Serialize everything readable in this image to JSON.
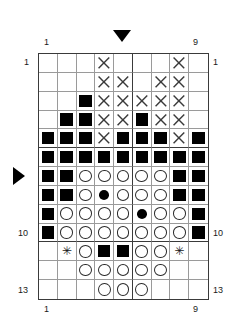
{
  "chart": {
    "columns": 9,
    "rows": 13,
    "legend_symbols": {
      "black_square": "filled-square",
      "cross": "x-cross",
      "open_circle": "open-circle",
      "filled_dot": "filled-dot",
      "asterisk": "asterisk",
      "empty": "blank"
    },
    "section_divider_after_column": 5,
    "section_divider_after_rows": [
      5,
      10
    ],
    "labels": {
      "top_left": "1",
      "top_right": "9",
      "bottom_left": "1",
      "bottom_right": "9",
      "left_row_first": "1",
      "left_row_ten": "10",
      "left_row_last": "13",
      "right_row_first": "1",
      "right_row_ten": "10",
      "right_row_last": "13"
    },
    "markers": {
      "top_center_triangle": "triangle-down",
      "left_row_triangle": "triangle-right",
      "left_triangle_row": 7,
      "top_triangle_column": 5
    },
    "grid": [
      [
        "e",
        "e",
        "e",
        "x",
        "e",
        "e",
        "e",
        "x",
        "e"
      ],
      [
        "e",
        "e",
        "e",
        "x",
        "x",
        "e",
        "x",
        "x",
        "e"
      ],
      [
        "e",
        "e",
        "s",
        "x",
        "x",
        "x",
        "x",
        "x",
        "e"
      ],
      [
        "e",
        "s",
        "s",
        "x",
        "x",
        "s",
        "x",
        "x",
        "e"
      ],
      [
        "s",
        "s",
        "s",
        "x",
        "s",
        "s",
        "s",
        "x",
        "s"
      ],
      [
        "s",
        "s",
        "s",
        "s",
        "s",
        "s",
        "s",
        "s",
        "s"
      ],
      [
        "s",
        "s",
        "o",
        "o",
        "o",
        "o",
        "o",
        "s",
        "s"
      ],
      [
        "s",
        "s",
        "o",
        "d",
        "o",
        "o",
        "o",
        "s",
        "s"
      ],
      [
        "s",
        "o",
        "o",
        "o",
        "o",
        "d",
        "o",
        "o",
        "s"
      ],
      [
        "s",
        "o",
        "o",
        "o",
        "o",
        "o",
        "o",
        "o",
        "s"
      ],
      [
        "e",
        "a",
        "o",
        "s",
        "s",
        "o",
        "o",
        "a",
        "e"
      ],
      [
        "e",
        "e",
        "o",
        "o",
        "o",
        "o",
        "o",
        "e",
        "e"
      ],
      [
        "e",
        "e",
        "e",
        "o",
        "o",
        "o",
        "e",
        "e",
        "e"
      ]
    ]
  }
}
